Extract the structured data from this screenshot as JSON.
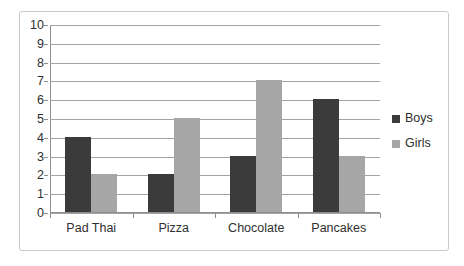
{
  "chart_data": {
    "type": "bar",
    "title": "",
    "subtitle": "",
    "xlabel": "",
    "ylabel": "",
    "categories": [
      "Pad Thai",
      "Pizza",
      "Chocolate",
      "Pancakes"
    ],
    "series": [
      {
        "name": "Boys",
        "values": [
          4,
          2,
          3,
          6
        ],
        "color": "#3b3b3b"
      },
      {
        "name": "Girls",
        "values": [
          2,
          5,
          7,
          3
        ],
        "color": "#a6a6a6"
      }
    ],
    "ylim": [
      0,
      10
    ],
    "ytick_step": 1,
    "ytick_labels": [
      "10",
      "9",
      "8",
      "7",
      "6",
      "5",
      "4",
      "3",
      "2",
      "1",
      "0"
    ],
    "grid": {
      "horizontal": true,
      "vertical": false
    },
    "legend": {
      "position": "right",
      "entries": [
        "Boys",
        "Girls"
      ]
    }
  },
  "legend": {
    "boys_label": "Boys",
    "girls_label": "Girls"
  },
  "colors": {
    "boys": "#3b3b3b",
    "girls": "#a6a6a6",
    "gridline": "#a3a3a3",
    "axis": "#8f8f8f",
    "frame_border": "#c9c9c9",
    "text": "#2f2f2f",
    "background": "#ffffff"
  }
}
